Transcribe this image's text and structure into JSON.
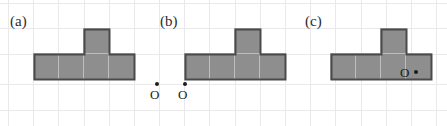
{
  "figure": {
    "width": 447,
    "height": 126,
    "background_color": "#ffffff",
    "grid": {
      "visible": true,
      "cell_size": 25,
      "line_color": "#e9e9ec",
      "vertical_lines_x": [
        8,
        33,
        58,
        84,
        109,
        134,
        159,
        184,
        209,
        235,
        260,
        285,
        310,
        335,
        361,
        386,
        411,
        436
      ],
      "horizontal_lines_y": [
        3,
        28,
        54,
        84,
        110
      ]
    },
    "shape": {
      "name": "T-pentomino",
      "fill_color": "#8e8e8e",
      "outline_color": "#4a4a4a",
      "divider_color": "#bdbdbd",
      "cell_size": 25,
      "bar_cells": 4,
      "stem_cell_index": 2,
      "description": "four unit squares in a horizontal row with one unit square resting on top of the third square"
    },
    "panels": [
      {
        "id": "panel-a",
        "label": "(a)",
        "label_x": 10,
        "label_y": 14,
        "shape_x": 33,
        "shape_y": 28,
        "point": {
          "label": "O",
          "label_x": 150,
          "label_y": 88,
          "dot_x": 155,
          "dot_y": 82,
          "position_note": "outside the shape, to the lower-right"
        }
      },
      {
        "id": "panel-b",
        "label": "(b)",
        "label_x": 160,
        "label_y": 14,
        "shape_x": 184,
        "shape_y": 28,
        "point": {
          "label": "O",
          "label_x": 178,
          "label_y": 88,
          "dot_x": 183,
          "dot_y": 82,
          "position_note": "on the bottom-left vertex of the shape"
        }
      },
      {
        "id": "panel-c",
        "label": "(c)",
        "label_x": 305,
        "label_y": 14,
        "shape_x": 330,
        "shape_y": 28,
        "point": {
          "label": "O",
          "label_x": 400,
          "label_y": 66,
          "dot_x": 414,
          "dot_y": 70,
          "position_note": "inside the shape, in the fourth bar square"
        }
      }
    ]
  }
}
